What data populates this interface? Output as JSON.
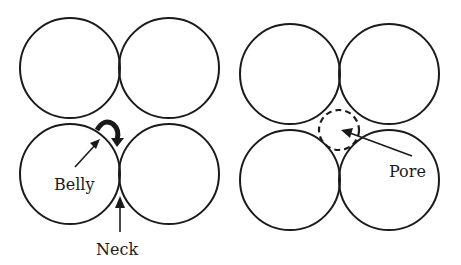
{
  "diagram": {
    "left_panel": {
      "description": "Four touching spheres with belly and neck regions",
      "labels": {
        "belly": "Belly",
        "neck": "Neck"
      }
    },
    "right_panel": {
      "description": "Four touching spheres with central pore (dashed circle)",
      "labels": {
        "pore": "Pore"
      }
    },
    "colors": {
      "stroke": "#1a1a1a",
      "background": "#ffffff"
    }
  }
}
